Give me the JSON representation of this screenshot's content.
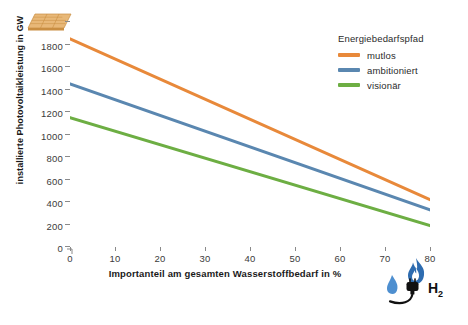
{
  "chart_data": {
    "type": "line",
    "title": "",
    "xlabel": "Importanteil am gesamten Wasserstoffbedarf in %",
    "ylabel": "installierte Photovoltaikleistung in GW",
    "xlim": [
      0,
      80
    ],
    "ylim": [
      0,
      2000
    ],
    "xticks": [
      0,
      10,
      20,
      30,
      40,
      50,
      60,
      70,
      80
    ],
    "xtick_labels": [
      "0",
      "10",
      "20",
      "30",
      "40",
      "50",
      "60",
      "70",
      "80"
    ],
    "yticks": [
      0,
      200,
      400,
      600,
      800,
      1000,
      1200,
      1400,
      1600,
      1800,
      2000
    ],
    "ytick_labels": [
      "0",
      "200",
      "400",
      "600",
      "800",
      "1000",
      "1200",
      "1400",
      "1600",
      "1800",
      ""
    ],
    "grid": false,
    "legend_position": "top-right",
    "legend_title": "Energiebedarfspfad",
    "x": [
      0,
      80
    ],
    "series": [
      {
        "name": "mutlos",
        "color": "#E8893A",
        "values": [
          1850,
          420
        ]
      },
      {
        "name": "ambitioniert",
        "color": "#5A87B0",
        "values": [
          1450,
          330
        ]
      },
      {
        "name": "visionär",
        "color": "#6DAE43",
        "values": [
          1150,
          190
        ]
      }
    ]
  },
  "icons": {
    "solar_panel": "solar-panel-icon",
    "hydrogen": "hydrogen-icon",
    "hydrogen_label": "H",
    "hydrogen_subscript": "2"
  },
  "colors": {
    "mutlos": "#E8893A",
    "ambitioniert": "#5A87B0",
    "visionaer": "#6DAE43",
    "axis": "#8a8a8a",
    "text": "#2b2b2b"
  }
}
